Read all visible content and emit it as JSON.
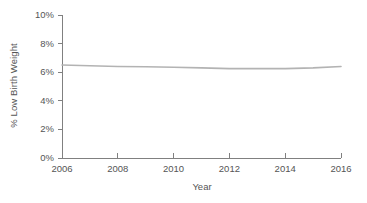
{
  "chart_data": {
    "type": "line",
    "title": "",
    "xlabel": "Year",
    "ylabel": "% Low Birth Weight",
    "x": [
      2006,
      2007,
      2008,
      2009,
      2010,
      2011,
      2012,
      2013,
      2014,
      2015,
      2016
    ],
    "values": [
      6.5,
      6.45,
      6.4,
      6.38,
      6.35,
      6.3,
      6.25,
      6.25,
      6.25,
      6.3,
      6.4
    ],
    "series": [
      {
        "name": "% Low Birth Weight",
        "values": [
          6.5,
          6.45,
          6.4,
          6.38,
          6.35,
          6.3,
          6.25,
          6.25,
          6.25,
          6.3,
          6.4
        ]
      }
    ],
    "xlim": [
      2006,
      2016
    ],
    "ylim": [
      0,
      10
    ],
    "xticks": [
      2006,
      2008,
      2010,
      2012,
      2014,
      2016
    ],
    "xtick_labels": [
      "2006",
      "2008",
      "2010",
      "2012",
      "2014",
      "2016"
    ],
    "yticks": [
      0,
      2,
      4,
      6,
      8,
      10
    ],
    "ytick_labels": [
      "0%",
      "2%",
      "4%",
      "6%",
      "8%",
      "10%"
    ],
    "grid": false,
    "legend": false,
    "line_color": "#b3b3b3",
    "axis_color": "#808080",
    "text_color": "#555555"
  }
}
